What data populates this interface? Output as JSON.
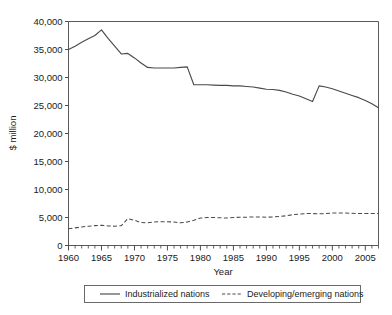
{
  "chart_data": {
    "type": "line",
    "title": "",
    "xlabel": "Year",
    "ylabel": "$ million",
    "xlim": [
      1960,
      2007
    ],
    "ylim": [
      0,
      40000
    ],
    "grid": false,
    "legend_position": "bottom",
    "y_ticks": [
      0,
      5000,
      10000,
      15000,
      20000,
      25000,
      30000,
      35000,
      40000
    ],
    "y_tick_labels": [
      "0",
      "5,000",
      "10,000",
      "15,000",
      "20,000",
      "25,000",
      "30,000",
      "35,000",
      "40,000"
    ],
    "x_ticks": [
      1960,
      1965,
      1970,
      1975,
      1980,
      1985,
      1990,
      1995,
      2000,
      2005
    ],
    "x_tick_labels": [
      "1960",
      "1965",
      "1970",
      "1975",
      "1980",
      "1985",
      "1990",
      "1995",
      "2000",
      "2005"
    ],
    "x_minor_tick_interval": 1,
    "x": [
      1960,
      1961,
      1962,
      1963,
      1964,
      1965,
      1966,
      1967,
      1968,
      1969,
      1970,
      1971,
      1972,
      1973,
      1974,
      1975,
      1976,
      1977,
      1978,
      1979,
      1980,
      1981,
      1982,
      1983,
      1984,
      1985,
      1986,
      1987,
      1988,
      1989,
      1990,
      1991,
      1992,
      1993,
      1994,
      1995,
      1996,
      1997,
      1998,
      1999,
      2000,
      2001,
      2002,
      2003,
      2004,
      2005,
      2006,
      2007
    ],
    "series": [
      {
        "name": "Industrialized nations",
        "style": "solid",
        "color": "#4a4a4a",
        "values": [
          35000,
          35600,
          36300,
          36900,
          37500,
          38500,
          37000,
          35600,
          34200,
          34300,
          33500,
          32600,
          31800,
          31700,
          31700,
          31700,
          31700,
          31800,
          31900,
          28700,
          28700,
          28700,
          28650,
          28600,
          28600,
          28500,
          28500,
          28400,
          28300,
          28100,
          27900,
          27850,
          27700,
          27400,
          27000,
          26700,
          26200,
          25700,
          28500,
          28300,
          28000,
          27600,
          27200,
          26800,
          26400,
          25900,
          25300,
          24600
        ]
      },
      {
        "name": "Developing/emerging nations",
        "style": "dashed",
        "color": "#4a4a4a",
        "values": [
          3000,
          3150,
          3300,
          3450,
          3550,
          3600,
          3500,
          3450,
          3550,
          4800,
          4500,
          4100,
          4050,
          4200,
          4250,
          4250,
          4200,
          4050,
          4200,
          4500,
          4900,
          5000,
          5000,
          4950,
          4900,
          5000,
          5050,
          5050,
          5100,
          5100,
          5050,
          5100,
          5200,
          5300,
          5500,
          5600,
          5700,
          5700,
          5650,
          5700,
          5800,
          5800,
          5800,
          5750,
          5700,
          5700,
          5700,
          5700
        ]
      }
    ],
    "legend": [
      {
        "label": "Industrialized nations",
        "style": "solid"
      },
      {
        "label": "Developing/emerging nations",
        "style": "dashed"
      }
    ]
  }
}
